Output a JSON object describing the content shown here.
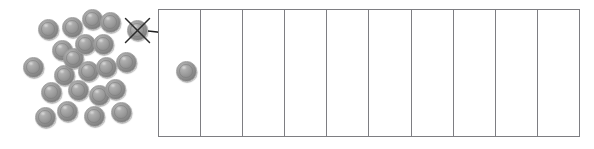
{
  "diagram": {
    "colors": {
      "sphere_fill": "#8f8f8f",
      "sphere_edge": "#9d9d9d",
      "grid_line": "#7e7e82",
      "cross_mark": "#2b2b2b",
      "arrow": "#1f1f1f",
      "background": "#ffffff"
    },
    "pile": {
      "label": "loose-counters-pile",
      "count": 21,
      "sphere_diameter": 21,
      "circles": [
        {
          "id": 1,
          "cx": 33,
          "cy": 67
        },
        {
          "id": 2,
          "cx": 48,
          "cy": 29
        },
        {
          "id": 3,
          "cx": 51,
          "cy": 92
        },
        {
          "id": 4,
          "cx": 45,
          "cy": 117
        },
        {
          "id": 5,
          "cx": 62,
          "cy": 50
        },
        {
          "id": 6,
          "cx": 64,
          "cy": 75
        },
        {
          "id": 7,
          "cx": 67,
          "cy": 111
        },
        {
          "id": 8,
          "cx": 72,
          "cy": 27
        },
        {
          "id": 9,
          "cx": 73,
          "cy": 58
        },
        {
          "id": 10,
          "cx": 78,
          "cy": 90
        },
        {
          "id": 11,
          "cx": 85,
          "cy": 44
        },
        {
          "id": 12,
          "cx": 88,
          "cy": 71
        },
        {
          "id": 13,
          "cx": 92,
          "cy": 19
        },
        {
          "id": 14,
          "cx": 94,
          "cy": 116
        },
        {
          "id": 15,
          "cx": 99,
          "cy": 95
        },
        {
          "id": 16,
          "cx": 103,
          "cy": 44
        },
        {
          "id": 17,
          "cx": 106,
          "cy": 67
        },
        {
          "id": 18,
          "cx": 110,
          "cy": 22
        },
        {
          "id": 19,
          "cx": 115,
          "cy": 89
        },
        {
          "id": 20,
          "cx": 121,
          "cy": 112
        },
        {
          "id": 21,
          "cx": 126,
          "cy": 62
        }
      ]
    },
    "crossed_counter": {
      "label": "counter-marked-for-transfer",
      "cx": 137,
      "cy": 30,
      "diameter": 21,
      "mark": "x-cross"
    },
    "arrow": {
      "label": "transfer-arrow",
      "from_x": 148,
      "from_y": 31,
      "to_x": 186,
      "to_y": 58,
      "style": "curved-with-arrowhead"
    },
    "grid": {
      "label": "ten-frame-strip",
      "x": 158,
      "y": 9,
      "width": 422,
      "height": 128,
      "columns": 10,
      "rows": 1,
      "cells": [
        {
          "index": 1,
          "filled": true,
          "counter_cx": 186,
          "counter_cy": 71,
          "counter_diameter": 21
        },
        {
          "index": 2,
          "filled": false
        },
        {
          "index": 3,
          "filled": false
        },
        {
          "index": 4,
          "filled": false
        },
        {
          "index": 5,
          "filled": false
        },
        {
          "index": 6,
          "filled": false
        },
        {
          "index": 7,
          "filled": false
        },
        {
          "index": 8,
          "filled": false
        },
        {
          "index": 9,
          "filled": false
        },
        {
          "index": 10,
          "filled": false
        }
      ]
    }
  }
}
